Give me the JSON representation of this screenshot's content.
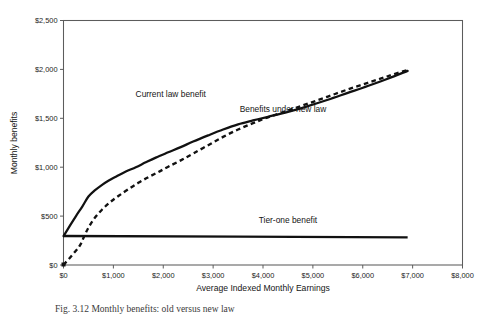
{
  "figure": {
    "caption": "Fig. 3.12   Monthly benefits: old versus new law"
  },
  "chart_data": {
    "type": "line",
    "title": "",
    "xlabel": "Average Indexed Monthly Earnings",
    "ylabel": "Monthly benefits",
    "xlim": [
      0,
      8000
    ],
    "ylim": [
      0,
      2500
    ],
    "grid": false,
    "legend_position": "inline-annotations",
    "xticks": [
      0,
      1000,
      2000,
      3000,
      4000,
      5000,
      6000,
      7000,
      8000
    ],
    "xticklabels": [
      "$0",
      "$1,000",
      "$2,000",
      "$3,000",
      "$4,000",
      "$5,000",
      "$6,000",
      "$7,000",
      "$8,000"
    ],
    "yticks": [
      0,
      500,
      1000,
      1500,
      2000,
      2500
    ],
    "yticklabels": [
      "$0",
      "$500",
      "$1,000",
      "$1,500",
      "$2,000",
      "$2,500"
    ],
    "annotations": [
      {
        "text": "Current law benefit",
        "x": 2150,
        "y": 1715
      },
      {
        "text": "Benefits under new law",
        "x": 4400,
        "y": 1560
      },
      {
        "text": "Tier-one benefit",
        "x": 4500,
        "y": 430
      }
    ],
    "series": [
      {
        "name": "Benefits under new law",
        "style": "solid",
        "color": "#111111",
        "points": [
          [
            0,
            295
          ],
          [
            120,
            395
          ],
          [
            250,
            500
          ],
          [
            380,
            600
          ],
          [
            500,
            700
          ],
          [
            620,
            760
          ],
          [
            760,
            815
          ],
          [
            900,
            862
          ],
          [
            1060,
            905
          ],
          [
            1250,
            955
          ],
          [
            1450,
            1000
          ],
          [
            1650,
            1050
          ],
          [
            1850,
            1098
          ],
          [
            2100,
            1152
          ],
          [
            2350,
            1205
          ],
          [
            2600,
            1262
          ],
          [
            2900,
            1325
          ],
          [
            3200,
            1385
          ],
          [
            3500,
            1438
          ],
          [
            3800,
            1478
          ],
          [
            4100,
            1515
          ],
          [
            4500,
            1565
          ],
          [
            4900,
            1625
          ],
          [
            5300,
            1690
          ],
          [
            5700,
            1760
          ],
          [
            6100,
            1830
          ],
          [
            6500,
            1905
          ],
          [
            6900,
            1985
          ]
        ]
      },
      {
        "name": "Current law benefit",
        "style": "dashed",
        "color": "#111111",
        "points": [
          [
            0,
            0
          ],
          [
            180,
            105
          ],
          [
            330,
            200
          ],
          [
            420,
            300
          ],
          [
            520,
            400
          ],
          [
            640,
            490
          ],
          [
            780,
            570
          ],
          [
            930,
            640
          ],
          [
            1100,
            705
          ],
          [
            1300,
            775
          ],
          [
            1500,
            840
          ],
          [
            1700,
            898
          ],
          [
            1900,
            950
          ],
          [
            2100,
            1005
          ],
          [
            2350,
            1070
          ],
          [
            2600,
            1140
          ],
          [
            2900,
            1225
          ],
          [
            3200,
            1310
          ],
          [
            3500,
            1385
          ],
          [
            3800,
            1450
          ],
          [
            4100,
            1510
          ],
          [
            4500,
            1580
          ],
          [
            4900,
            1650
          ],
          [
            5300,
            1722
          ],
          [
            5700,
            1795
          ],
          [
            6100,
            1862
          ],
          [
            6500,
            1930
          ],
          [
            6900,
            1995
          ]
        ]
      },
      {
        "name": "Tier-one benefit",
        "style": "solid-flat",
        "color": "#111111",
        "points": [
          [
            0,
            297
          ],
          [
            3500,
            290
          ],
          [
            6900,
            282
          ]
        ]
      }
    ]
  }
}
